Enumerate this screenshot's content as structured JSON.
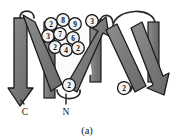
{
  "figure": {
    "name": "protein-topology-ribbon-diagram",
    "caption": "(a)",
    "background_color": "#ffffff",
    "strand_fill": "#777777",
    "strand_fill_light": "#9a9a9a",
    "outline_color": "#1a1a1a",
    "circle_fill": "#f2f2f2",
    "loop_color": "#2a2a2a"
  },
  "terminals": [
    {
      "label": "C",
      "x": 25,
      "y": 112
    },
    {
      "label": "N",
      "x": 66,
      "y": 112
    }
  ],
  "residues": [
    {
      "id": "r1",
      "label": "2",
      "cx": 51,
      "cy": 24
    },
    {
      "id": "r2",
      "label": "8",
      "cx": 63,
      "cy": 20
    },
    {
      "id": "r3",
      "label": "9",
      "cx": 75,
      "cy": 24
    },
    {
      "id": "r4",
      "label": "3",
      "cx": 92,
      "cy": 21
    },
    {
      "id": "r5",
      "label": "3",
      "cx": 48,
      "cy": 36
    },
    {
      "id": "r6",
      "label": "7",
      "cx": 60,
      "cy": 34
    },
    {
      "id": "r7",
      "label": "6",
      "cx": 73,
      "cy": 38
    },
    {
      "id": "r8",
      "label": "2",
      "cx": 55,
      "cy": 47
    },
    {
      "id": "r9",
      "label": "4",
      "cx": 66,
      "cy": 50
    },
    {
      "id": "r10",
      "label": "2",
      "cx": 78,
      "cy": 48
    },
    {
      "id": "r11",
      "label": "2",
      "cx": 69,
      "cy": 85
    },
    {
      "id": "r12",
      "label": "2",
      "cx": 124,
      "cy": 88
    }
  ],
  "strands": [
    {
      "id": "s1",
      "name": "beta-strand-1"
    },
    {
      "id": "s2",
      "name": "beta-strand-2"
    },
    {
      "id": "s3",
      "name": "beta-strand-3"
    },
    {
      "id": "s4",
      "name": "beta-strand-4"
    },
    {
      "id": "s5",
      "name": "beta-strand-5"
    },
    {
      "id": "s6",
      "name": "beta-strand-6"
    }
  ]
}
